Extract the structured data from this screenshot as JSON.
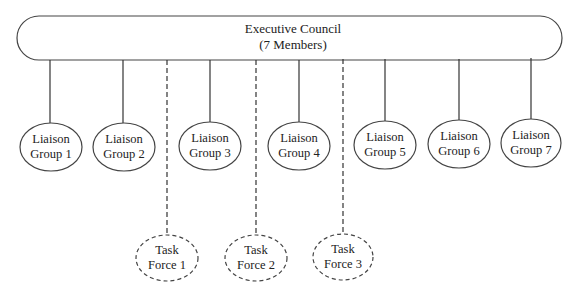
{
  "diagram": {
    "type": "organizational-chart",
    "colors": {
      "stroke": "#444444",
      "text": "#222222",
      "background": "#ffffff"
    },
    "council": {
      "title": "Executive Council",
      "subtitle": "(7 Members)"
    },
    "liaison_groups": [
      {
        "line1": "Liaison",
        "line2": "Group 1"
      },
      {
        "line1": "Liaison",
        "line2": "Group 2"
      },
      {
        "line1": "Liaison",
        "line2": "Group 3"
      },
      {
        "line1": "Liaison",
        "line2": "Group 4"
      },
      {
        "line1": "Liaison",
        "line2": "Group 5"
      },
      {
        "line1": "Liaison",
        "line2": "Group 6"
      },
      {
        "line1": "Liaison",
        "line2": "Group 7"
      }
    ],
    "task_forces": [
      {
        "line1": "Task",
        "line2": "Force 1"
      },
      {
        "line1": "Task",
        "line2": "Force 2"
      },
      {
        "line1": "Task",
        "line2": "Force 3"
      }
    ],
    "connections": {
      "council_to_liaison": "solid",
      "council_to_task_force": "dashed"
    }
  }
}
